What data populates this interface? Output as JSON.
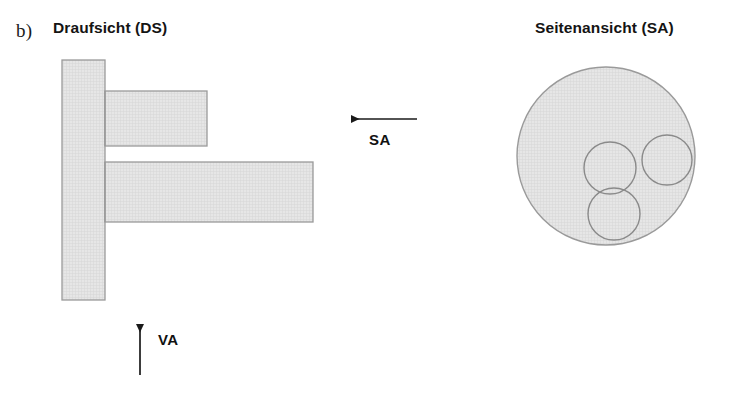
{
  "figure": {
    "part_label": "b)",
    "width": 736,
    "height": 395,
    "background": "#ffffff"
  },
  "views": {
    "top_view": {
      "title_text": "Draufsicht (DS)",
      "title_plain": "Draufsicht (",
      "title_bold": "DS",
      "title_close": ")",
      "abbreviation": "DS",
      "shapes": [
        {
          "name": "vertical-flange-bar",
          "type": "rect",
          "x": 62,
          "y": 60,
          "width": 43,
          "height": 240
        },
        {
          "name": "upper-horizontal-bar",
          "type": "rect",
          "x": 105,
          "y": 91,
          "width": 102,
          "height": 55
        },
        {
          "name": "lower-horizontal-bar",
          "type": "rect",
          "x": 105,
          "y": 162,
          "width": 208,
          "height": 60
        }
      ]
    },
    "side_view": {
      "title_text": "Seitenansicht (SA)",
      "title_plain": "Seitenansicht (",
      "title_bold": "SA",
      "title_close": ")",
      "abbreviation": "SA",
      "shapes": [
        {
          "name": "outer-circle",
          "type": "circle",
          "cx": 606,
          "cy": 156,
          "r": 89
        },
        {
          "name": "inner-circle-center",
          "type": "circle",
          "cx": 610,
          "cy": 168,
          "r": 26
        },
        {
          "name": "inner-circle-right",
          "type": "circle",
          "cx": 667,
          "cy": 160,
          "r": 25
        },
        {
          "name": "inner-circle-bottom",
          "type": "circle",
          "cx": 614,
          "cy": 214,
          "r": 26
        }
      ]
    }
  },
  "annotations": {
    "side_arrow": {
      "label": "SA",
      "direction": "left",
      "x1": 417,
      "y1": 119,
      "x2": 345,
      "y2": 119,
      "label_x": 369,
      "label_y": 131
    },
    "front_arrow": {
      "label": "VA",
      "direction": "up",
      "x1": 140,
      "y1": 375,
      "x2": 140,
      "y2": 318,
      "label_x": 158,
      "label_y": 331
    }
  },
  "style": {
    "hatch_fill": "#e3e3e3",
    "hatch_line": "#d2d2d2",
    "shape_stroke": "#8c8c8c",
    "arrow_color": "#1a1a1a",
    "text_color": "#141414"
  }
}
